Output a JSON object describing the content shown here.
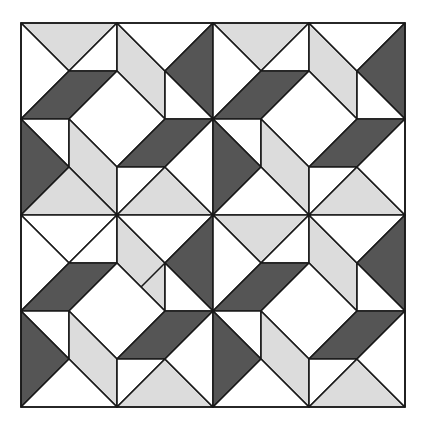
{
  "diagram": {
    "type": "geometric-tiling",
    "grid": {
      "blocks_x": 2,
      "blocks_y": 2,
      "units_per_block": 4,
      "unit_px": 48,
      "origin": [
        21,
        23
      ]
    },
    "colors": {
      "dark": "#555555",
      "light": "#dcdcdc",
      "white": "#ffffff",
      "line": "#1a1a1a"
    },
    "blocks": [
      {
        "id": "top-left",
        "bx": 0,
        "by": 0,
        "top_triangle": "light",
        "bottom_left_triangle": "light",
        "extra_line": false
      },
      {
        "id": "top-right",
        "bx": 1,
        "by": 0,
        "top_triangle": "light",
        "bottom_left_triangle": "white",
        "extra_line": false
      },
      {
        "id": "bottom-left",
        "bx": 0,
        "by": 1,
        "top_triangle": "white",
        "bottom_left_triangle": "white",
        "extra_line": true
      },
      {
        "id": "bottom-right",
        "bx": 1,
        "by": 1,
        "top_triangle": "light",
        "bottom_left_triangle": "white",
        "extra_line": false
      }
    ]
  }
}
